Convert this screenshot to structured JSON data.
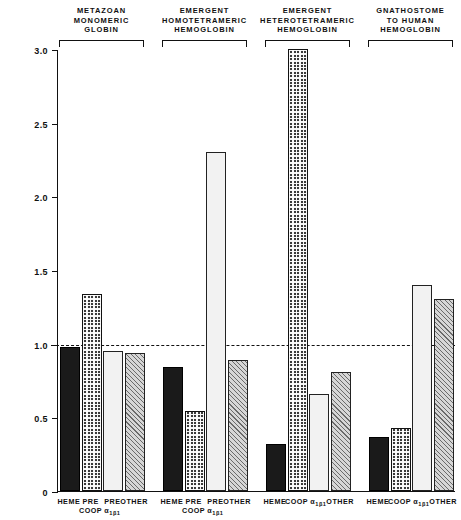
{
  "chart_data": {
    "type": "bar",
    "title": "",
    "subtitle": "",
    "xlabel": "",
    "ylabel": "",
    "ylim": [
      0,
      3.0
    ],
    "ytick_labels": [
      "0",
      "0.5",
      "1.0",
      "1.5",
      "2.0",
      "2.5",
      "3.0"
    ],
    "ytick_values": [
      0,
      0.5,
      1.0,
      1.5,
      2.0,
      2.5,
      3.0
    ],
    "grid": false,
    "legend_position": "none",
    "reference_line": 1.0,
    "categories": [
      "HEME",
      "COOP",
      "a1b1",
      "OTHER"
    ],
    "groups": [
      {
        "title": "METAZOAN\nMONOMERIC\nGLOBIN",
        "bars": [
          {
            "label_line1": "HEME",
            "label_line2": "",
            "sub": "",
            "value": 0.98,
            "pattern": "solid-black"
          },
          {
            "label_line1": "PRE",
            "label_line2": "COOP",
            "sub": "",
            "value": 1.34,
            "pattern": "dark-checkered"
          },
          {
            "label_line1": "PRE",
            "label_line2": "α",
            "sub": "1β1",
            "value": 0.95,
            "pattern": "light-dotted"
          },
          {
            "label_line1": "OTHER",
            "label_line2": "",
            "sub": "",
            "value": 0.94,
            "pattern": "diagonal-hatch"
          }
        ]
      },
      {
        "title": "EMERGENT\nHOMOTETRAMERIC\nHEMOGLOBIN",
        "bars": [
          {
            "label_line1": "HEME",
            "label_line2": "",
            "sub": "",
            "value": 0.84,
            "pattern": "solid-black"
          },
          {
            "label_line1": "PRE",
            "label_line2": "COOP",
            "sub": "",
            "value": 0.54,
            "pattern": "dark-checkered"
          },
          {
            "label_line1": "PRE",
            "label_line2": "α",
            "sub": "1β1",
            "value": 2.3,
            "pattern": "light-dotted"
          },
          {
            "label_line1": "OTHER",
            "label_line2": "",
            "sub": "",
            "value": 0.89,
            "pattern": "diagonal-hatch"
          }
        ]
      },
      {
        "title": "EMERGENT\nHETEROTETRAMERIC\nHEMOGLOBIN",
        "bars": [
          {
            "label_line1": "HEME",
            "label_line2": "",
            "sub": "",
            "value": 0.32,
            "pattern": "solid-black"
          },
          {
            "label_line1": "COOP",
            "label_line2": "",
            "sub": "",
            "value": 3.0,
            "pattern": "dark-checkered"
          },
          {
            "label_line1": "α",
            "label_line2": "",
            "sub": "1β1",
            "value": 0.66,
            "pattern": "light-dotted"
          },
          {
            "label_line1": "OTHER",
            "label_line2": "",
            "sub": "",
            "value": 0.81,
            "pattern": "diagonal-hatch"
          }
        ]
      },
      {
        "title": "GNATHOSTOME\nTO  HUMAN\nHEMOGLOBIN",
        "bars": [
          {
            "label_line1": "HEME",
            "label_line2": "",
            "sub": "",
            "value": 0.37,
            "pattern": "solid-black"
          },
          {
            "label_line1": "COOP",
            "label_line2": "",
            "sub": "",
            "value": 0.43,
            "pattern": "dark-checkered"
          },
          {
            "label_line1": "α",
            "label_line2": "",
            "sub": "1β1",
            "value": 1.4,
            "pattern": "light-dotted"
          },
          {
            "label_line1": "OTHER",
            "label_line2": "",
            "sub": "",
            "value": 1.3,
            "pattern": "diagonal-hatch"
          }
        ]
      }
    ]
  }
}
